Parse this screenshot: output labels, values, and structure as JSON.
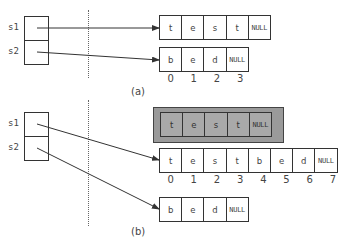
{
  "panel_a": {
    "caption": "(a)",
    "labels": {
      "s1": "s1",
      "s2": "s2"
    },
    "array_s1": [
      "t",
      "e",
      "s",
      "t",
      "NULL"
    ],
    "array_s2": [
      "b",
      "e",
      "d",
      "NULL"
    ],
    "indices": [
      "0",
      "1",
      "2",
      "3"
    ]
  },
  "panel_b": {
    "caption": "(b)",
    "labels": {
      "s1": "s1",
      "s2": "s2"
    },
    "old_array_freed": [
      "t",
      "e",
      "s",
      "t",
      "NULL"
    ],
    "array_s1": [
      "t",
      "e",
      "s",
      "t",
      "b",
      "e",
      "d",
      "NULL"
    ],
    "indices": [
      "0",
      "1",
      "2",
      "3",
      "4",
      "5",
      "6",
      "7"
    ],
    "array_s2": [
      "b",
      "e",
      "d",
      "NULL"
    ]
  },
  "colors": {
    "stroke": "#333333",
    "freed_block": "#a9a9a9",
    "freed_frame": "#9a9a9a"
  }
}
